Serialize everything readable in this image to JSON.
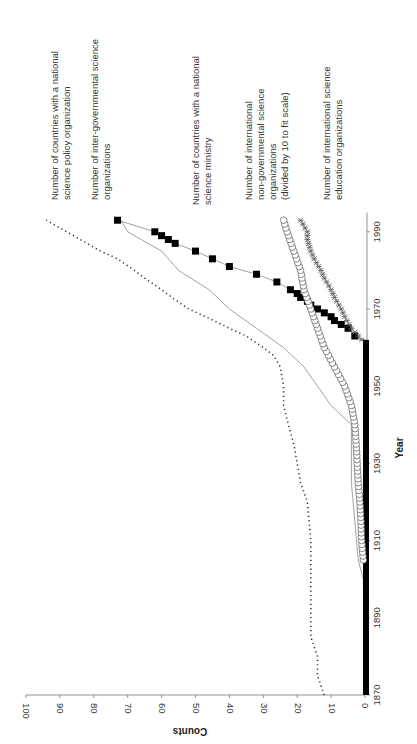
{
  "chart_data": {
    "type": "line",
    "orientation": "rotated-90-ccw",
    "title": "",
    "xlabel": "Year",
    "ylabel": "Counts",
    "xlim": [
      1870,
      1995
    ],
    "ylim": [
      0,
      100
    ],
    "x_ticks": [
      1870,
      1890,
      1910,
      1930,
      1950,
      1970,
      1990
    ],
    "y_ticks": [
      0,
      10,
      20,
      30,
      40,
      50,
      60,
      70,
      80,
      90,
      100
    ],
    "grid": false,
    "legend_position": "inline-annotations",
    "series": [
      {
        "name": "Number of countries with a national science policy organization",
        "style": "dotted",
        "color": "#333333",
        "label_lines": [
          "Number of countries with a national",
          "science policy organization"
        ],
        "points": [
          [
            1870,
            12
          ],
          [
            1875,
            14
          ],
          [
            1880,
            14
          ],
          [
            1885,
            16
          ],
          [
            1890,
            16
          ],
          [
            1900,
            16
          ],
          [
            1910,
            16
          ],
          [
            1920,
            17
          ],
          [
            1925,
            19
          ],
          [
            1930,
            20
          ],
          [
            1935,
            21
          ],
          [
            1938,
            22
          ],
          [
            1945,
            24
          ],
          [
            1950,
            24
          ],
          [
            1955,
            25
          ],
          [
            1958,
            27
          ],
          [
            1960,
            30
          ],
          [
            1963,
            35
          ],
          [
            1965,
            40
          ],
          [
            1968,
            47
          ],
          [
            1970,
            52
          ],
          [
            1973,
            57
          ],
          [
            1975,
            60
          ],
          [
            1978,
            65
          ],
          [
            1980,
            68
          ],
          [
            1983,
            73
          ],
          [
            1985,
            78
          ],
          [
            1988,
            84
          ],
          [
            1990,
            88
          ],
          [
            1993,
            94
          ]
        ]
      },
      {
        "name": "Number of inter-governmental science organizations",
        "style": "solid",
        "color": "#999999",
        "label_lines": [
          "Number of inter-governmental science",
          "organizations"
        ],
        "points": [
          [
            1870,
            0
          ],
          [
            1900,
            0.5
          ],
          [
            1905,
            2
          ],
          [
            1915,
            3
          ],
          [
            1925,
            4
          ],
          [
            1940,
            4
          ],
          [
            1945,
            10
          ],
          [
            1950,
            14
          ],
          [
            1955,
            18
          ],
          [
            1960,
            24
          ],
          [
            1965,
            32
          ],
          [
            1970,
            40
          ],
          [
            1975,
            46
          ],
          [
            1980,
            55
          ],
          [
            1985,
            60
          ],
          [
            1990,
            70
          ],
          [
            1993,
            72
          ]
        ]
      },
      {
        "name": "Number of countries with a national science ministry",
        "style": "square-markers",
        "color": "#000000",
        "label_lines": [
          "Number of countries with a national",
          "science ministry"
        ],
        "points": [
          [
            1870,
            0
          ],
          [
            1880,
            0
          ],
          [
            1890,
            0
          ],
          [
            1900,
            0
          ],
          [
            1910,
            0
          ],
          [
            1920,
            0
          ],
          [
            1930,
            0
          ],
          [
            1940,
            0
          ],
          [
            1950,
            0
          ],
          [
            1960,
            0
          ],
          [
            1962,
            0
          ],
          [
            1963,
            3
          ],
          [
            1965,
            5
          ],
          [
            1966,
            7
          ],
          [
            1967,
            9
          ],
          [
            1968,
            10
          ],
          [
            1969,
            12
          ],
          [
            1970,
            14
          ],
          [
            1971,
            16
          ],
          [
            1972,
            17
          ],
          [
            1973,
            19
          ],
          [
            1974,
            20
          ],
          [
            1975,
            22
          ],
          [
            1977,
            26
          ],
          [
            1979,
            32
          ],
          [
            1981,
            40
          ],
          [
            1983,
            45
          ],
          [
            1985,
            50
          ],
          [
            1987,
            56
          ],
          [
            1988,
            58
          ],
          [
            1989,
            60
          ],
          [
            1990,
            62
          ],
          [
            1993,
            73
          ]
        ]
      },
      {
        "name": "Number of international non-governmental science organizations (divided by 10 to fit scale)",
        "style": "circle-markers",
        "color": "#555555",
        "label_lines": [
          "Number of international",
          "non-governmental science",
          "organizations",
          "(divided by 10 to fit scale)"
        ],
        "points": [
          [
            1870,
            0
          ],
          [
            1880,
            0
          ],
          [
            1890,
            0
          ],
          [
            1900,
            0
          ],
          [
            1905,
            0.5
          ],
          [
            1910,
            1
          ],
          [
            1915,
            1.2
          ],
          [
            1920,
            1.5
          ],
          [
            1925,
            2
          ],
          [
            1930,
            2.3
          ],
          [
            1935,
            2.6
          ],
          [
            1940,
            3
          ],
          [
            1945,
            4
          ],
          [
            1950,
            6
          ],
          [
            1955,
            9
          ],
          [
            1960,
            12
          ],
          [
            1965,
            14
          ],
          [
            1970,
            16
          ],
          [
            1975,
            18
          ],
          [
            1980,
            19
          ],
          [
            1985,
            21
          ],
          [
            1990,
            23
          ],
          [
            1993,
            24
          ]
        ]
      },
      {
        "name": "Number of international science education organizations",
        "style": "star-markers",
        "color": "#666666",
        "label_lines": [
          "Number of international science",
          "education organizations"
        ],
        "points": [
          [
            1962,
            1
          ],
          [
            1965,
            4
          ],
          [
            1968,
            6
          ],
          [
            1970,
            7
          ],
          [
            1973,
            9
          ],
          [
            1975,
            10
          ],
          [
            1978,
            12
          ],
          [
            1980,
            13
          ],
          [
            1983,
            15
          ],
          [
            1985,
            16
          ],
          [
            1988,
            17
          ],
          [
            1990,
            17
          ],
          [
            1993,
            19
          ]
        ]
      }
    ]
  }
}
